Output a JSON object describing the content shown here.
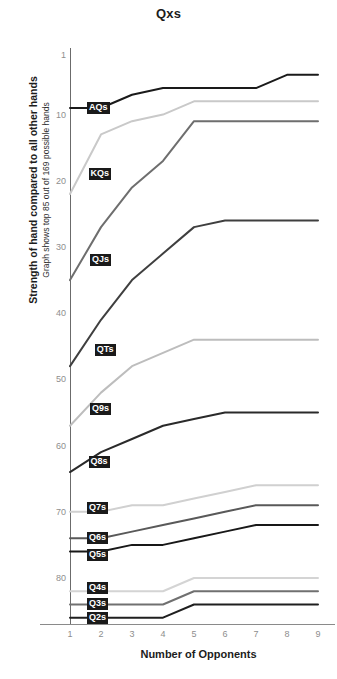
{
  "chart_data": {
    "type": "line",
    "title": "Qxs",
    "subtitle": "",
    "xlabel": "Number of Opponents",
    "ylabel": "Strength of hand compared to all other hands",
    "ylabel_sub": "Graph shows top 85 out of 169 possible hands",
    "x": [
      1,
      2,
      3,
      4,
      5,
      6,
      7,
      8,
      9
    ],
    "xticks": [
      "1",
      "2",
      "3",
      "4",
      "5",
      "6",
      "7",
      "8",
      "9"
    ],
    "yticks": [
      "1",
      "10",
      "20",
      "30",
      "40",
      "50",
      "60",
      "70",
      "80"
    ],
    "ytick_values": [
      1,
      10,
      20,
      30,
      40,
      50,
      60,
      70,
      80
    ],
    "ylim": [
      1,
      86
    ],
    "y_inverted": true,
    "xlim": [
      1,
      9
    ],
    "grid": false,
    "legend_position": "inline-labels",
    "series": [
      {
        "name": "AQs",
        "color": "#1a1a1a",
        "width": 2.0,
        "values": [
          9,
          9,
          7,
          6,
          6,
          6,
          6,
          4,
          4
        ]
      },
      {
        "name": "KQs",
        "color": "#c9c9c9",
        "width": 2.0,
        "values": [
          22,
          13,
          11,
          10,
          8,
          8,
          8,
          8,
          8
        ]
      },
      {
        "name": "QJs",
        "color": "#6e6e6e",
        "width": 2.0,
        "values": [
          35,
          27,
          21,
          17,
          11,
          11,
          11,
          11,
          11
        ]
      },
      {
        "name": "QTs",
        "color": "#3f3f3f",
        "width": 2.0,
        "values": [
          48,
          41,
          35,
          31,
          27,
          26,
          26,
          26,
          26
        ]
      },
      {
        "name": "Q9s",
        "color": "#bdbdbd",
        "width": 2.0,
        "values": [
          57,
          52,
          48,
          46,
          44,
          44,
          44,
          44,
          44
        ]
      },
      {
        "name": "Q8s",
        "color": "#2a2a2a",
        "width": 2.0,
        "values": [
          64,
          61,
          59,
          57,
          56,
          55,
          55,
          55,
          55
        ]
      },
      {
        "name": "Q7s",
        "color": "#d0d0d0",
        "width": 2.0,
        "values": [
          70,
          70,
          69,
          69,
          68,
          67,
          66,
          66,
          66
        ]
      },
      {
        "name": "Q6s",
        "color": "#595959",
        "width": 2.0,
        "values": [
          74,
          74,
          73,
          72,
          71,
          70,
          69,
          69,
          69
        ]
      },
      {
        "name": "Q5s",
        "color": "#181818",
        "width": 2.0,
        "values": [
          76,
          76,
          75,
          75,
          74,
          73,
          72,
          72,
          72
        ]
      },
      {
        "name": "Q4s",
        "color": "#d4d4d4",
        "width": 2.0,
        "values": [
          82,
          82,
          82,
          82,
          80,
          80,
          80,
          80,
          80
        ]
      },
      {
        "name": "Q3s",
        "color": "#707070",
        "width": 2.0,
        "values": [
          84,
          84,
          84,
          84,
          82,
          82,
          82,
          82,
          82
        ]
      },
      {
        "name": "Q2s",
        "color": "#1f1f1f",
        "width": 2.0,
        "values": [
          86,
          86,
          86,
          86,
          84,
          84,
          84,
          84,
          84
        ]
      }
    ],
    "label_anchors": [
      {
        "name": "AQs",
        "x": 1,
        "y": 9
      },
      {
        "name": "KQs",
        "x": 1.05,
        "y": 19
      },
      {
        "name": "QJs",
        "x": 1.1,
        "y": 32
      },
      {
        "name": "QTs",
        "x": 1.25,
        "y": 45.5
      },
      {
        "name": "Q9s",
        "x": 1.1,
        "y": 54.5
      },
      {
        "name": "Q8s",
        "x": 1.05,
        "y": 62.5
      },
      {
        "name": "Q7s",
        "x": 1.0,
        "y": 69.5
      },
      {
        "name": "Q6s",
        "x": 1.0,
        "y": 74
      },
      {
        "name": "Q5s",
        "x": 1.0,
        "y": 76.5
      },
      {
        "name": "Q4s",
        "x": 1.0,
        "y": 81.5
      },
      {
        "name": "Q3s",
        "x": 1.0,
        "y": 84
      },
      {
        "name": "Q2s",
        "x": 1.0,
        "y": 86
      }
    ]
  },
  "colors": {
    "background": "#ffffff",
    "axis": "#6b6b6b",
    "tick_text": "#8e8e8e",
    "title_text": "#1c1c1c",
    "label_badge_bg": "#1a1a1a",
    "label_badge_text": "#ffffff"
  }
}
